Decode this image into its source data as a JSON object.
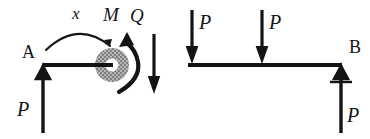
{
  "figure": {
    "type": "free-body-diagram",
    "title": "",
    "stroke_color": "#141414",
    "hatch_color": "#9a9a9a",
    "background_color": "#ffffff"
  },
  "left_diagram": {
    "name": "cut-section-free-body",
    "support_label": "A",
    "dimension_label": "x",
    "moment_label": "M",
    "shear_label": "Q",
    "reaction_label": "P",
    "beam": {
      "x1": 43,
      "y1": 65,
      "x2": 112,
      "y2": 65
    },
    "cut_circle": {
      "cx": 112,
      "cy": 65,
      "r_outer": 17,
      "r_inner": 6
    },
    "support": {
      "cx": 43,
      "cy": 65,
      "half_width": 7,
      "height": 12
    },
    "reaction_arrow": {
      "x": 43,
      "y_tail": 133,
      "y_head": 68
    },
    "shear_arrow": {
      "x": 138,
      "y_tail": 34,
      "y_head": 92
    },
    "moment_arc": {
      "cx": 112,
      "cy": 65,
      "r": 28
    },
    "dimension_arc": {
      "x_start": 45,
      "x_end": 112,
      "y": 47,
      "apex_y": 24
    }
  },
  "right_diagram": {
    "name": "full-beam-free-body",
    "support_label": "B",
    "load_labels": [
      "P",
      "P"
    ],
    "reaction_label": "P",
    "beam": {
      "x1": 188,
      "y1": 65,
      "x2": 341,
      "y2": 65
    },
    "load_arrows": [
      {
        "x": 192,
        "y_tail": 10,
        "y_head": 62
      },
      {
        "x": 262,
        "y_tail": 10,
        "y_head": 62
      }
    ],
    "support": {
      "cx": 341,
      "cy": 67,
      "half_width": 7,
      "height": 12
    },
    "ground_line": {
      "x1": 329,
      "x2": 353,
      "y": 82
    },
    "reaction_arrow": {
      "x": 341,
      "y_tail": 133,
      "y_head": 70
    }
  },
  "labels": {
    "A": {
      "text": "A",
      "x": 22,
      "y": 58,
      "size": 18,
      "italic": false
    },
    "x": {
      "text": "x",
      "x": 72,
      "y": 19,
      "size": 17,
      "italic": true
    },
    "M": {
      "text": "M",
      "x": 103,
      "y": 21,
      "size": 19,
      "italic": true
    },
    "Q": {
      "text": "Q",
      "x": 128,
      "y": 22,
      "size": 19,
      "italic": true
    },
    "P_left": {
      "text": "P",
      "x": 18,
      "y": 116,
      "size": 19,
      "italic": true
    },
    "P_load_1": {
      "text": "P",
      "x": 199,
      "y": 29,
      "size": 19,
      "italic": true
    },
    "P_load_2": {
      "text": "P",
      "x": 269,
      "y": 29,
      "size": 19,
      "italic": true
    },
    "B": {
      "text": "B",
      "x": 349,
      "y": 53,
      "size": 18,
      "italic": false
    },
    "P_right": {
      "text": "P",
      "x": 348,
      "y": 122,
      "size": 19,
      "italic": true
    }
  }
}
